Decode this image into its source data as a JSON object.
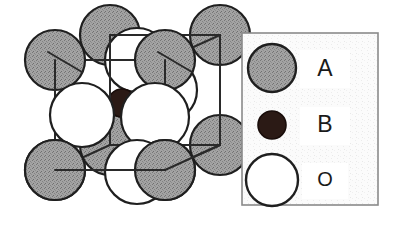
{
  "figure": {
    "background_color": "#ffffff",
    "line_color": "#2a2a2a"
  },
  "colors": {
    "atom_a_fill": "#9b9b9b",
    "atom_b_fill": "#2b1a15",
    "atom_o_fill": "#ffffff",
    "outline": "#1f1f1f",
    "legend_border": "#8a8a8a",
    "legend_background": "#fbfbfb"
  },
  "crystal": {
    "name": "unit-cell-diagram",
    "cube": {
      "front": [
        [
          55,
          60
        ],
        [
          165,
          60
        ],
        [
          165,
          170
        ],
        [
          55,
          170
        ]
      ],
      "back": [
        [
          110,
          35
        ],
        [
          220,
          35
        ],
        [
          220,
          145
        ],
        [
          110,
          145
        ]
      ]
    },
    "atoms_a": [
      {
        "id": "A-front-top-left",
        "cx": 55,
        "cy": 60,
        "r": 30
      },
      {
        "id": "A-front-top-right",
        "cx": 165,
        "cy": 60,
        "r": 30
      },
      {
        "id": "A-front-bottom-left",
        "cx": 55,
        "cy": 170,
        "r": 30
      },
      {
        "id": "A-front-bottom-right",
        "cx": 165,
        "cy": 170,
        "r": 30
      },
      {
        "id": "A-back-top-left",
        "cx": 110,
        "cy": 35,
        "r": 30
      },
      {
        "id": "A-back-top-right",
        "cx": 220,
        "cy": 35,
        "r": 30
      },
      {
        "id": "A-back-bottom-left",
        "cx": 110,
        "cy": 145,
        "r": 30
      },
      {
        "id": "A-back-bottom-right",
        "cx": 220,
        "cy": 145,
        "r": 30
      }
    ],
    "atoms_o": [
      {
        "id": "O-face-left",
        "cx": 82,
        "cy": 115,
        "r": 32
      },
      {
        "id": "O-face-right",
        "cx": 192,
        "cy": 115,
        "r": 32
      },
      {
        "id": "O-face-top",
        "cx": 137,
        "cy": 60,
        "r": 32
      },
      {
        "id": "O-face-bottom",
        "cx": 137,
        "cy": 170,
        "r": 32
      },
      {
        "id": "O-face-front",
        "cx": 110,
        "cy": 115,
        "r": 32
      },
      {
        "id": "O-face-back",
        "cx": 165,
        "cy": 90,
        "r": 32
      }
    ],
    "atoms_b": [
      {
        "id": "B-body-center",
        "cx": 122,
        "cy": 103,
        "r": 14
      }
    ],
    "radii": {
      "atom_a": 30,
      "atom_b": 14,
      "atom_o": 32
    }
  },
  "legend": {
    "name": "legend-box",
    "box": {
      "x": 242,
      "y": 33,
      "width": 136,
      "height": 172
    },
    "items": [
      {
        "label": "A",
        "symbol": "large-gray-circle",
        "fill": "#9b9b9b",
        "radius": 24,
        "cx": 272,
        "cy": 68,
        "label_x": 325,
        "label_y": 70
      },
      {
        "label": "B",
        "symbol": "small-dark-circle",
        "fill": "#2b1a15",
        "radius": 14,
        "cx": 272,
        "cy": 125,
        "label_x": 325,
        "label_y": 126
      },
      {
        "label": "O",
        "symbol": "large-white-circle",
        "fill": "#ffffff",
        "radius": 26,
        "cx": 272,
        "cy": 180,
        "label_x": 325,
        "label_y": 181
      }
    ]
  }
}
